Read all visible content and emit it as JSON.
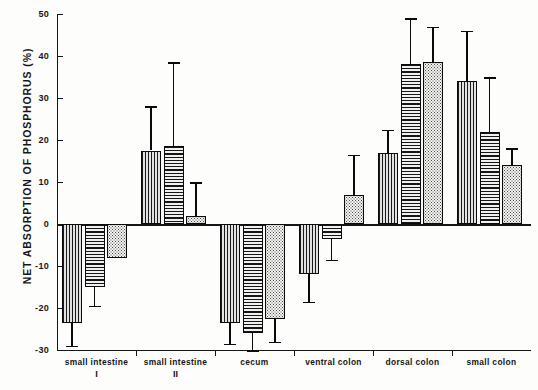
{
  "chart_data": {
    "type": "bar",
    "title": "",
    "xlabel": "",
    "ylabel": "NET ABSORPTION OF PHOSPHORUS (%)",
    "ylim": [
      -30,
      50
    ],
    "ytick_values": [
      50,
      40,
      30,
      20,
      10,
      0,
      -10,
      -20,
      -30
    ],
    "ytick_labels": [
      "50",
      "40",
      "30",
      "20",
      "10",
      "0",
      "-10",
      "-20",
      "-30"
    ],
    "grid": false,
    "legend_position": "bottom-right",
    "categories": [
      "small intestine I",
      "small intestine II",
      "cecum",
      "ventral colon",
      "dorsal colon",
      "small colon"
    ],
    "category_labels": [
      {
        "main": "small intestine",
        "sub": "I"
      },
      {
        "main": "small intestine",
        "sub": "II"
      },
      {
        "main": "cecum",
        "sub": ""
      },
      {
        "main": "ventral colon",
        "sub": ""
      },
      {
        "main": "dorsal colon",
        "sub": ""
      },
      {
        "main": "small colon",
        "sub": ""
      }
    ],
    "series": [
      {
        "name": "ALFALFA (0.26% P)",
        "pattern": "vertical-stripes",
        "values": [
          -23.5,
          17.5,
          -23.5,
          -12.0,
          17.0,
          34.0
        ],
        "err_low": [
          -29.0,
          7.5,
          -28.5,
          -18.5,
          12.0,
          27.0
        ],
        "err_high": [
          -23.5,
          28.0,
          -23.5,
          -12.0,
          22.5,
          46.0
        ]
      },
      {
        "name": "ALFALFA - CORN (0.32% P)",
        "pattern": "horizontal-stripes",
        "values": [
          -15.0,
          18.5,
          -26.0,
          -3.5,
          38.0,
          22.0
        ],
        "err_low": [
          -19.5,
          18.5,
          -30.0,
          -8.5,
          27.0,
          8.5
        ],
        "err_high": [
          -13.0,
          38.5,
          -22.0,
          1.5,
          49.0,
          35.0
        ]
      },
      {
        "name": "CORN (0.42% P)",
        "pattern": "stipple-dots",
        "values": [
          -8.0,
          2.0,
          -22.5,
          7.0,
          38.5,
          14.0
        ],
        "err_low": [
          -8.0,
          -5.0,
          -28.0,
          7.0,
          38.5,
          11.0
        ],
        "err_high": [
          -8.0,
          10.0,
          -22.5,
          16.5,
          47.0,
          18.0
        ]
      }
    ]
  },
  "legend": {
    "items": [
      {
        "label": "ALFALFA (0.26% P)",
        "swatch": "sw-vert"
      },
      {
        "label": "ALFALFA - CORN (0.32% P)",
        "swatch": "sw-horz"
      },
      {
        "label": "CORN (0.42% P)",
        "swatch": "sw-dots"
      }
    ]
  }
}
